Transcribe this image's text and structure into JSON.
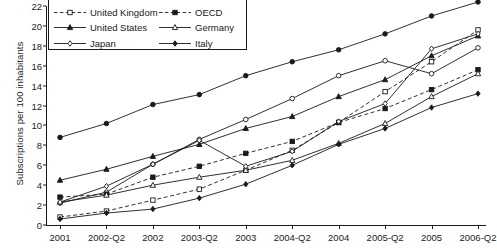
{
  "chart_data": {
    "type": "line",
    "title": "",
    "xlabel": "",
    "ylabel": "Subscriptions per 100 inhabitants",
    "categories": [
      "2001",
      "2002-Q2",
      "2002",
      "2003-Q2",
      "2003",
      "2004-Q2",
      "2004",
      "2005-Q2",
      "2005",
      "2006-Q2"
    ],
    "ylim": [
      0,
      22
    ],
    "ytick_step": 2,
    "yticks": [
      "0",
      "2",
      "4",
      "6",
      "8",
      "10",
      "12",
      "14",
      "16",
      "18",
      "20",
      "22"
    ],
    "grid": false,
    "legend_position": "top-left-inside",
    "legend_columns": 2,
    "series": [
      {
        "name": "Canada",
        "marker": "filled-circle",
        "line": "solid",
        "values": [
          8.8,
          10.2,
          12.1,
          13.1,
          15.0,
          16.4,
          17.6,
          19.2,
          21.0,
          22.4
        ]
      },
      {
        "name": "France",
        "marker": "open-circle",
        "line": "solid",
        "values": [
          2.2,
          3.3,
          6.1,
          8.6,
          10.6,
          12.7,
          15.0,
          16.5,
          15.2,
          17.8
        ]
      },
      {
        "name": "United Kingdom",
        "marker": "open-square",
        "line": "dashed",
        "values": [
          0.8,
          1.4,
          2.5,
          3.6,
          5.5,
          7.5,
          10.3,
          13.4,
          16.4,
          19.6
        ]
      },
      {
        "name": "OECD",
        "marker": "filled-square",
        "line": "dashed",
        "values": [
          2.8,
          3.1,
          4.8,
          5.9,
          7.2,
          8.4,
          10.3,
          11.7,
          13.6,
          15.6
        ]
      },
      {
        "name": "United States",
        "marker": "filled-triangle",
        "line": "solid",
        "values": [
          4.5,
          5.6,
          6.9,
          8.1,
          9.7,
          10.9,
          12.9,
          14.6,
          17.0,
          19.0
        ]
      },
      {
        "name": "Germany",
        "marker": "open-triangle",
        "line": "solid",
        "values": [
          2.3,
          3.0,
          4.0,
          4.8,
          5.5,
          6.5,
          8.2,
          10.2,
          12.9,
          15.2
        ]
      },
      {
        "name": "Japan",
        "marker": "open-diamond",
        "line": "solid",
        "values": [
          2.3,
          3.9,
          6.1,
          8.5,
          5.9,
          7.4,
          10.4,
          12.2,
          17.7,
          19.2
        ]
      },
      {
        "name": "Italy",
        "marker": "filled-diamond",
        "line": "solid",
        "values": [
          0.6,
          1.2,
          1.6,
          2.7,
          4.1,
          6.0,
          8.1,
          9.7,
          11.8,
          13.2
        ]
      }
    ]
  },
  "legend": {
    "entries": [
      {
        "label": "Canada"
      },
      {
        "label": "France"
      },
      {
        "label": "United Kingdom"
      },
      {
        "label": "OECD"
      },
      {
        "label": "United States"
      },
      {
        "label": "Germany"
      },
      {
        "label": "Japan"
      },
      {
        "label": "Italy"
      }
    ]
  }
}
